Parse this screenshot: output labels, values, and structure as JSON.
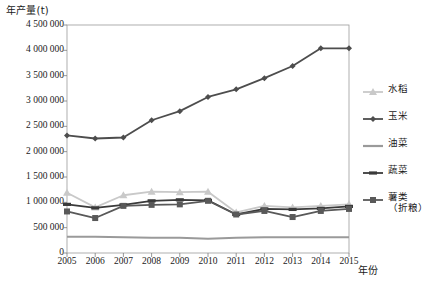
{
  "chart_data": {
    "type": "line",
    "title": "",
    "xlabel": "年份",
    "ylabel": "年产量(t)",
    "ylim": [
      0,
      4500000
    ],
    "ytick_values": [
      0,
      500000,
      1000000,
      1500000,
      2000000,
      2500000,
      3000000,
      3500000,
      4000000,
      4500000
    ],
    "ytick_labels": [
      "0",
      "500 000",
      "1 000 000",
      "1 500 000",
      "2 000 000",
      "2 500 000",
      "3 000 000",
      "3 500 000",
      "4 000 000",
      "4 500 000"
    ],
    "categories": [
      2005,
      2006,
      2007,
      2008,
      2009,
      2010,
      2011,
      2012,
      2013,
      2014,
      2015
    ],
    "xtick_labels": [
      "2005",
      "2006",
      "2007",
      "2008",
      "2009",
      "2010",
      "2011",
      "2012",
      "2013",
      "2014",
      "2015"
    ],
    "grid": false,
    "legend_position": "right",
    "series": [
      {
        "name": "水稻",
        "marker": "triangle",
        "color": "#c9c9c9",
        "values": [
          1190000,
          900000,
          1140000,
          1210000,
          1200000,
          1210000,
          800000,
          930000,
          900000,
          930000,
          960000
        ]
      },
      {
        "name": "玉米",
        "marker": "diamond",
        "color": "#4d4d4d",
        "values": [
          2320000,
          2260000,
          2280000,
          2620000,
          2800000,
          3080000,
          3230000,
          3450000,
          3690000,
          4040000,
          4040000
        ]
      },
      {
        "name": "油菜",
        "marker": "none",
        "color": "#9a9a9a",
        "values": [
          320000,
          320000,
          310000,
          300000,
          300000,
          280000,
          300000,
          310000,
          310000,
          310000,
          310000
        ]
      },
      {
        "name": "蔬菜",
        "marker": "dash",
        "color": "#3a3a3a",
        "values": [
          960000,
          890000,
          950000,
          1030000,
          1050000,
          1040000,
          760000,
          870000,
          860000,
          880000,
          920000
        ]
      },
      {
        "name": "薯类(折粮)",
        "marker": "square",
        "color": "#595959",
        "values": [
          820000,
          690000,
          930000,
          950000,
          960000,
          1030000,
          760000,
          830000,
          710000,
          830000,
          870000
        ]
      }
    ]
  },
  "legend": {
    "items": [
      {
        "label": "水稻",
        "sub": ""
      },
      {
        "label": "玉米",
        "sub": ""
      },
      {
        "label": "油菜",
        "sub": ""
      },
      {
        "label": "蔬菜",
        "sub": ""
      },
      {
        "label": "薯类",
        "sub": "（折粮）"
      }
    ]
  }
}
